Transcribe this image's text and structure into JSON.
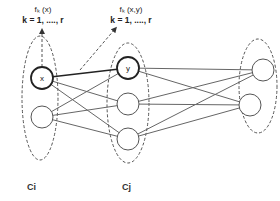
{
  "diagram": {
    "type": "neural-network-clusters",
    "colors": {
      "edge": "#666666",
      "edge_strong": "#222222",
      "dashed": "#555555",
      "node_stroke": "#555555",
      "background": "#ffffff"
    },
    "annotations": [
      {
        "id": "fx",
        "function": "fₖ (x)",
        "range": "k = 1, ...., r"
      },
      {
        "id": "fxy",
        "function": "fₖ (x,y)",
        "range": "k = 1, ...., r"
      }
    ],
    "clusters": [
      {
        "id": "ci",
        "label": "Ci",
        "nodes": [
          {
            "id": "x",
            "label": "x",
            "highlight": true
          },
          {
            "id": "ci2",
            "label": ""
          }
        ]
      },
      {
        "id": "cj",
        "label": "Cj",
        "nodes": [
          {
            "id": "y",
            "label": "y",
            "highlight": true
          },
          {
            "id": "cj2",
            "label": ""
          },
          {
            "id": "cj3",
            "label": ""
          }
        ]
      },
      {
        "id": "ck",
        "label": "",
        "nodes": [
          {
            "id": "ck1",
            "label": ""
          },
          {
            "id": "ck2",
            "label": ""
          }
        ]
      }
    ],
    "edges": [
      [
        "x",
        "y",
        true
      ],
      [
        "x",
        "cj2",
        false
      ],
      [
        "x",
        "cj3",
        false
      ],
      [
        "ci2",
        "y",
        false
      ],
      [
        "ci2",
        "cj2",
        false
      ],
      [
        "ci2",
        "cj3",
        false
      ],
      [
        "y",
        "ck1",
        false
      ],
      [
        "y",
        "ck2",
        false
      ],
      [
        "cj2",
        "ck1",
        false
      ],
      [
        "cj2",
        "ck2",
        false
      ],
      [
        "cj3",
        "ck1",
        false
      ],
      [
        "cj3",
        "ck2",
        false
      ]
    ]
  }
}
